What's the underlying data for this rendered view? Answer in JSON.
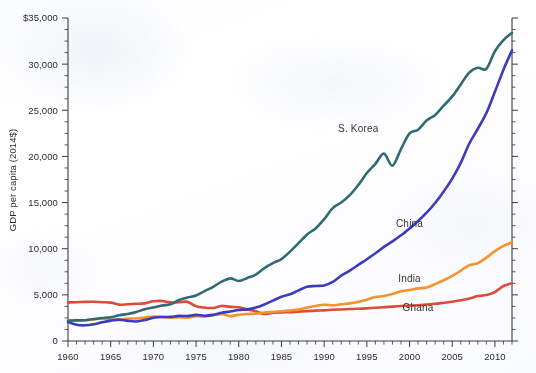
{
  "chart_data": {
    "type": "line",
    "title": "",
    "subtitle": "",
    "xlabel": "",
    "ylabel": "GDP per capita (2014$)",
    "xlim": [
      1960,
      2012
    ],
    "ylim": [
      0,
      35000
    ],
    "grid": false,
    "legend_position": "inline-annotations",
    "y_ticks": [
      0,
      5000,
      10000,
      15000,
      20000,
      25000,
      30000,
      35000
    ],
    "y_tick_labels": [
      "0",
      "5,000",
      "10,000",
      "15,000",
      "20,000",
      "25,000",
      "30,000",
      "$35,000"
    ],
    "y_minor_tick_step": 1250,
    "x_ticks": [
      1960,
      1965,
      1970,
      1975,
      1980,
      1985,
      1990,
      1995,
      2000,
      2005,
      2010
    ],
    "x_tick_labels": [
      "1960",
      "1965",
      "1970",
      "1975",
      "1980",
      "1985",
      "1990",
      "1995",
      "2000",
      "2005",
      "2010"
    ],
    "x_minor_tick_step": 1,
    "x": [
      1960,
      1961,
      1962,
      1963,
      1964,
      1965,
      1966,
      1967,
      1968,
      1969,
      1970,
      1971,
      1972,
      1973,
      1974,
      1975,
      1976,
      1977,
      1978,
      1979,
      1980,
      1981,
      1982,
      1983,
      1984,
      1985,
      1986,
      1987,
      1988,
      1989,
      1990,
      1991,
      1992,
      1993,
      1994,
      1995,
      1996,
      1997,
      1998,
      1999,
      2000,
      2001,
      2002,
      2003,
      2004,
      2005,
      2006,
      2007,
      2008,
      2009,
      2010,
      2011,
      2012
    ],
    "series": [
      {
        "name": "S. Korea",
        "color": "#2e6b73",
        "label_x": 1994,
        "label_y": 22700,
        "values": [
          2200,
          2230,
          2250,
          2390,
          2490,
          2580,
          2790,
          2930,
          3150,
          3450,
          3640,
          3840,
          3980,
          4440,
          4720,
          4930,
          5400,
          5870,
          6430,
          6790,
          6500,
          6830,
          7200,
          7900,
          8440,
          8880,
          9690,
          10600,
          11550,
          12200,
          13200,
          14400,
          15000,
          15800,
          16900,
          18200,
          19200,
          20300,
          19000,
          20800,
          22500,
          22900,
          23900,
          24500,
          25500,
          26500,
          27800,
          29100,
          29600,
          29500,
          31400,
          32600,
          33400
        ]
      },
      {
        "name": "China",
        "color": "#3b3bbd",
        "label_x": 2000,
        "label_y": 12400,
        "values": [
          2050,
          1760,
          1700,
          1810,
          2030,
          2210,
          2320,
          2180,
          2120,
          2280,
          2520,
          2600,
          2610,
          2720,
          2710,
          2830,
          2740,
          2830,
          3050,
          3200,
          3350,
          3430,
          3620,
          3960,
          4380,
          4800,
          5060,
          5480,
          5870,
          5960,
          6020,
          6400,
          7080,
          7630,
          8250,
          8860,
          9510,
          10200,
          10800,
          11450,
          12200,
          13000,
          13900,
          14950,
          16200,
          17600,
          19300,
          21400,
          23000,
          24700,
          27000,
          29400,
          31500
        ]
      },
      {
        "name": "India",
        "color": "#f2932f",
        "label_x": 2000,
        "label_y": 6400,
        "values": [
          2230,
          2260,
          2250,
          2330,
          2450,
          2320,
          2290,
          2420,
          2440,
          2550,
          2660,
          2610,
          2520,
          2570,
          2530,
          2690,
          2640,
          2800,
          2910,
          2700,
          2840,
          2930,
          2960,
          3090,
          3150,
          3230,
          3310,
          3400,
          3640,
          3800,
          3920,
          3870,
          3980,
          4080,
          4240,
          4480,
          4760,
          4880,
          5080,
          5380,
          5520,
          5700,
          5790,
          6170,
          6580,
          7050,
          7620,
          8220,
          8430,
          9030,
          9740,
          10300,
          10700
        ]
      },
      {
        "name": "Ghana",
        "color": "#e04a38",
        "label_x": 2001,
        "label_y": 3200,
        "values": [
          4180,
          4200,
          4240,
          4250,
          4200,
          4160,
          3940,
          3980,
          4030,
          4080,
          4300,
          4340,
          4180,
          4200,
          4240,
          3760,
          3620,
          3580,
          3800,
          3700,
          3660,
          3420,
          3220,
          2920,
          3060,
          3100,
          3120,
          3180,
          3240,
          3290,
          3320,
          3390,
          3420,
          3460,
          3490,
          3540,
          3600,
          3660,
          3730,
          3790,
          3830,
          3870,
          3950,
          4030,
          4140,
          4250,
          4420,
          4610,
          4870,
          4980,
          5300,
          5960,
          6250
        ]
      }
    ]
  }
}
